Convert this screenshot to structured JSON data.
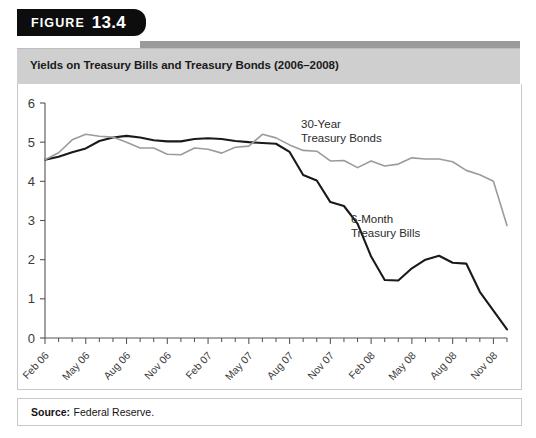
{
  "figure": {
    "tab_word": "FIGURE",
    "tab_number": "13.4",
    "title": "Yields on Treasury Bills and Treasury Bonds (2006–2008)",
    "source_label": "Source:",
    "source_value": "Federal Reserve."
  },
  "colors": {
    "tab_background": "#0d0d0d",
    "title_background": "#cfcfcf",
    "panel_background": "#ffffff",
    "border": "#c8c8c8",
    "bills_line": "#1a1a1a",
    "bonds_line": "#9b9b9b",
    "axis": "#555555",
    "text": "#2b2b2b"
  },
  "chart_data": {
    "type": "line",
    "title": "Yields on Treasury Bills and Treasury Bonds (2006–2008)",
    "xlabel": "",
    "ylabel": "",
    "ylim": [
      0,
      6
    ],
    "yticks": [
      0,
      1,
      2,
      3,
      4,
      5,
      6
    ],
    "grid": false,
    "legend_position": "inline-annotations",
    "x_tick_labels": [
      "Feb 06",
      "May 06",
      "Aug 06",
      "Nov 06",
      "Feb 07",
      "May 07",
      "Aug 07",
      "Nov 07",
      "Feb 08",
      "May 08",
      "Aug 08",
      "Nov 08"
    ],
    "x_tick_indices": [
      0,
      3,
      6,
      9,
      12,
      15,
      18,
      21,
      24,
      27,
      30,
      33
    ],
    "x_months": [
      "Feb 06",
      "Mar 06",
      "Apr 06",
      "May 06",
      "Jun 06",
      "Jul 06",
      "Aug 06",
      "Sep 06",
      "Oct 06",
      "Nov 06",
      "Dec 06",
      "Jan 07",
      "Feb 07",
      "Mar 07",
      "Apr 07",
      "May 07",
      "Jun 07",
      "Jul 07",
      "Aug 07",
      "Sep 07",
      "Oct 07",
      "Nov 07",
      "Dec 07",
      "Jan 08",
      "Feb 08",
      "Mar 08",
      "Apr 08",
      "May 08",
      "Jun 08",
      "Jul 08",
      "Aug 08",
      "Sep 08",
      "Oct 08",
      "Nov 08",
      "Dec 08"
    ],
    "series": [
      {
        "name": "6-Month Treasury Bills",
        "color": "#1a1a1a",
        "label_line1": "6-Month",
        "label_line2": "Treasury Bills",
        "values": [
          4.55,
          4.63,
          4.74,
          4.84,
          5.03,
          5.12,
          5.16,
          5.12,
          5.05,
          5.02,
          5.02,
          5.08,
          5.1,
          5.08,
          5.03,
          5.0,
          4.98,
          4.96,
          4.75,
          4.16,
          4.02,
          3.47,
          3.37,
          2.92,
          2.08,
          1.48,
          1.47,
          1.78,
          2.0,
          2.1,
          1.92,
          1.9,
          1.18,
          0.7,
          0.22
        ]
      },
      {
        "name": "30-Year Treasury Bonds",
        "color": "#9b9b9b",
        "label_line1": "30-Year",
        "label_line2": "Treasury Bonds",
        "values": [
          4.55,
          4.73,
          5.06,
          5.2,
          5.15,
          5.13,
          5.0,
          4.85,
          4.85,
          4.69,
          4.68,
          4.85,
          4.82,
          4.72,
          4.87,
          4.9,
          5.2,
          5.11,
          4.93,
          4.79,
          4.77,
          4.52,
          4.53,
          4.35,
          4.52,
          4.39,
          4.44,
          4.6,
          4.57,
          4.57,
          4.5,
          4.28,
          4.17,
          4.0,
          2.87
        ]
      }
    ]
  }
}
